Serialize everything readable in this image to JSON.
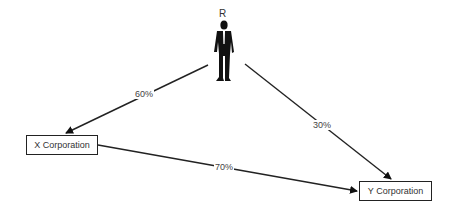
{
  "nodes": {
    "person": {
      "label": "R"
    },
    "x_corp": {
      "label": "X Corporation"
    },
    "y_corp": {
      "label": "Y Corporation"
    }
  },
  "edges": [
    {
      "from": "R",
      "to": "X Corporation",
      "label": "60%"
    },
    {
      "from": "R",
      "to": "Y Corporation",
      "label": "30%"
    },
    {
      "from": "X Corporation",
      "to": "Y Corporation",
      "label": "70%"
    }
  ]
}
